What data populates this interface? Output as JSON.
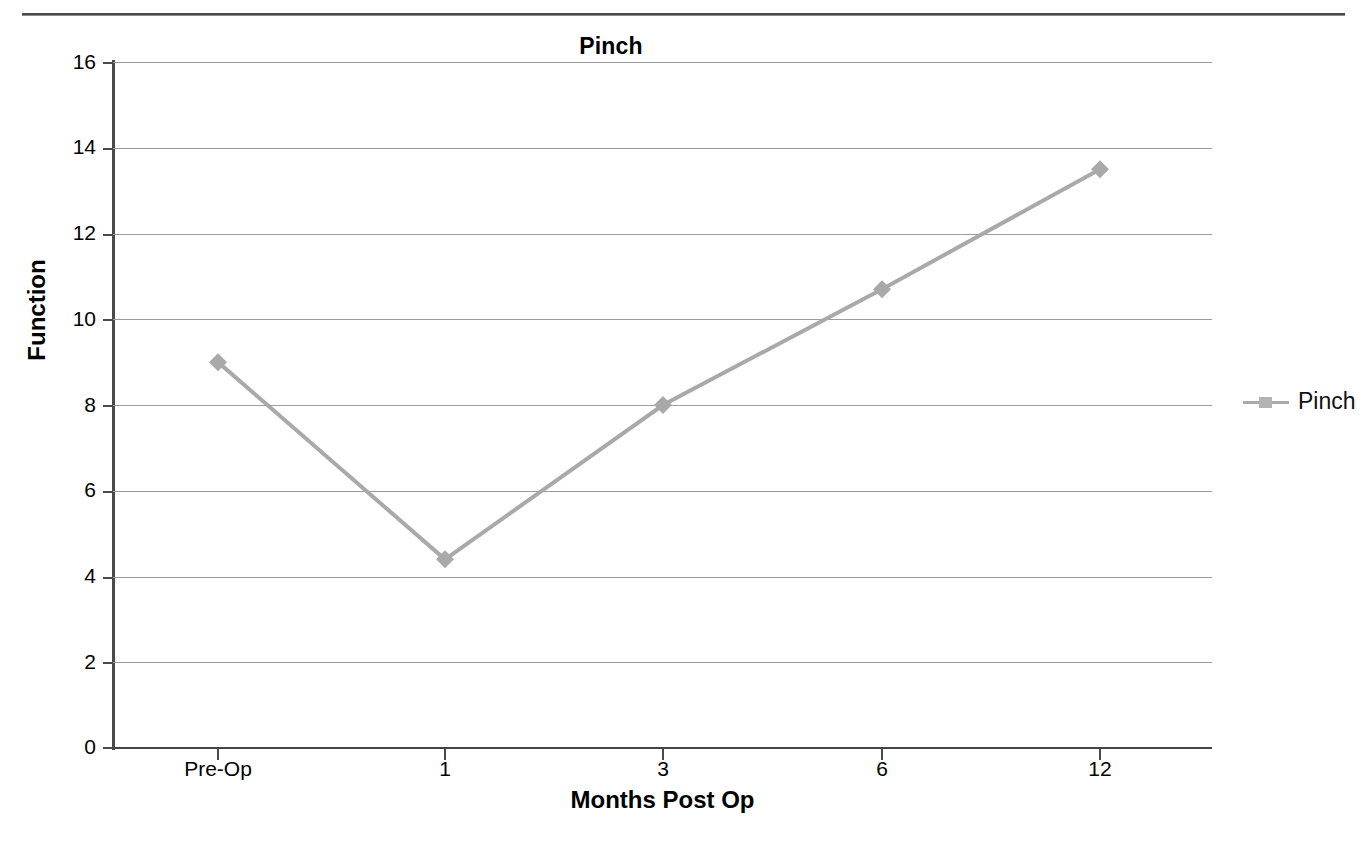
{
  "chart_data": {
    "type": "line",
    "title": "Pinch",
    "xlabel": "Months Post Op",
    "ylabel": "Function",
    "categories": [
      "Pre-Op",
      "1",
      "3",
      "6",
      "12"
    ],
    "series": [
      {
        "name": "Pinch",
        "values": [
          9.0,
          4.4,
          8.0,
          10.7,
          13.5
        ],
        "color": "#a9a9a9",
        "marker": "diamond"
      }
    ],
    "ylim": [
      0,
      16
    ],
    "ytick_step": 2,
    "yticks": [
      "0",
      "2",
      "4",
      "6",
      "8",
      "10",
      "12",
      "14",
      "16"
    ],
    "grid": true,
    "legend_position": "right",
    "legend_entries": [
      "Pinch"
    ]
  },
  "legend": {
    "items": [
      {
        "label": "Pinch",
        "color": "#a9a9a9"
      }
    ]
  }
}
